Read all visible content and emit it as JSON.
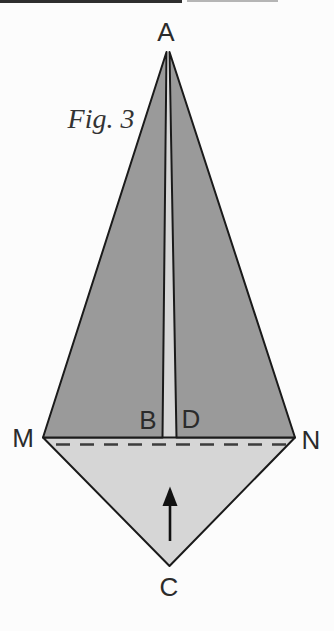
{
  "figure": {
    "caption": "Fig. 3"
  },
  "labels": {
    "apex": "A",
    "slit_left": "B",
    "slit_right": "D",
    "fold_left": "M",
    "fold_right": "N",
    "bottom": "C"
  },
  "fold_arrow": {
    "direction": "up"
  },
  "colors": {
    "flap_dark": "#9a9a9a",
    "paper_light": "#d6d6d6",
    "outline": "#1a1a1a",
    "fold_dash": "#3d3d3d",
    "arrow": "#111111",
    "label_text": "#2b2b2b",
    "background": "#fcfcfc"
  }
}
